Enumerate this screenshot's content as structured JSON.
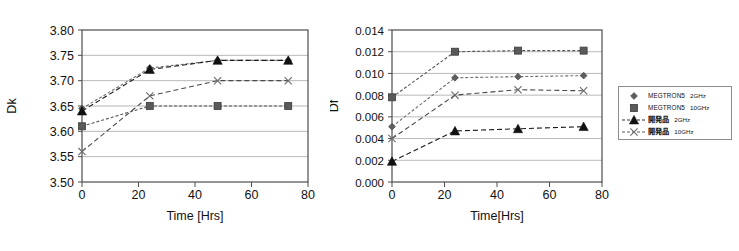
{
  "figure": {
    "background": "#ffffff",
    "width": 739,
    "height": 251
  },
  "legend": {
    "position": "right",
    "border_color": "#8d8d8d",
    "entries": [
      {
        "name": "MEGTRON5",
        "freq": "2GHz",
        "marker": "diamond",
        "line": "dotted",
        "color": "#6f6f6f"
      },
      {
        "name": "MEGTRON5",
        "freq": "10GHz",
        "marker": "square",
        "line": "dotted",
        "color": "#555555"
      },
      {
        "name": "開発品",
        "freq": "2GHz",
        "marker": "triangle",
        "line": "dashed",
        "color": "#1a1a1a"
      },
      {
        "name": "開発品",
        "freq": "10GHz",
        "marker": "cross",
        "line": "dashed",
        "color": "#4a4a4a"
      }
    ]
  },
  "chart_data": [
    {
      "id": "dk",
      "type": "line",
      "title": "",
      "xlabel": "Time [Hrs]",
      "ylabel": "Dk",
      "x": [
        0,
        24,
        48,
        73
      ],
      "xlim": [
        0,
        80
      ],
      "xticks": [
        0,
        20,
        40,
        60,
        80
      ],
      "xtick_labels": [
        "0",
        "20",
        "40",
        "60",
        "80"
      ],
      "ylim": [
        3.5,
        3.8
      ],
      "yticks": [
        3.5,
        3.55,
        3.6,
        3.65,
        3.7,
        3.75,
        3.8
      ],
      "ytick_labels": [
        "3.50",
        "3.55",
        "3.60",
        "3.65",
        "3.70",
        "3.75",
        "3.80"
      ],
      "grid": "horizontal",
      "series": [
        {
          "name": "MEGTRON5 2GHz",
          "marker": "diamond",
          "values": [
            3.645,
            3.725,
            3.74,
            3.74
          ]
        },
        {
          "name": "MEGTRON5 10GHz",
          "marker": "square",
          "values": [
            3.61,
            3.65,
            3.65,
            3.65
          ]
        },
        {
          "name": "開発品 2GHz",
          "marker": "triangle",
          "values": [
            3.64,
            3.722,
            3.74,
            3.74
          ]
        },
        {
          "name": "開発品 10GHz",
          "marker": "cross",
          "values": [
            3.56,
            3.67,
            3.7,
            3.7
          ]
        }
      ]
    },
    {
      "id": "df",
      "type": "line",
      "title": "",
      "xlabel": "Time[Hrs]",
      "ylabel": "Df",
      "x": [
        0,
        24,
        48,
        73
      ],
      "xlim": [
        0,
        80
      ],
      "xticks": [
        0,
        20,
        40,
        60,
        80
      ],
      "xtick_labels": [
        "0",
        "20",
        "40",
        "60",
        "80"
      ],
      "ylim": [
        0.0,
        0.014
      ],
      "yticks": [
        0.0,
        0.002,
        0.004,
        0.006,
        0.008,
        0.01,
        0.012,
        0.014
      ],
      "ytick_labels": [
        "0.000",
        "0.002",
        "0.004",
        "0.006",
        "0.008",
        "0.010",
        "0.012",
        "0.014"
      ],
      "grid": "horizontal",
      "series": [
        {
          "name": "MEGTRON5 2GHz",
          "marker": "diamond",
          "values": [
            0.0051,
            0.0096,
            0.0097,
            0.0098
          ]
        },
        {
          "name": "MEGTRON5 10GHz",
          "marker": "square",
          "values": [
            0.0078,
            0.012,
            0.0121,
            0.0121
          ]
        },
        {
          "name": "開発品 2GHz",
          "marker": "triangle",
          "values": [
            0.0019,
            0.0047,
            0.0049,
            0.0051
          ]
        },
        {
          "name": "開発品 10GHz",
          "marker": "cross",
          "values": [
            0.004,
            0.008,
            0.0085,
            0.0084
          ]
        }
      ]
    }
  ]
}
